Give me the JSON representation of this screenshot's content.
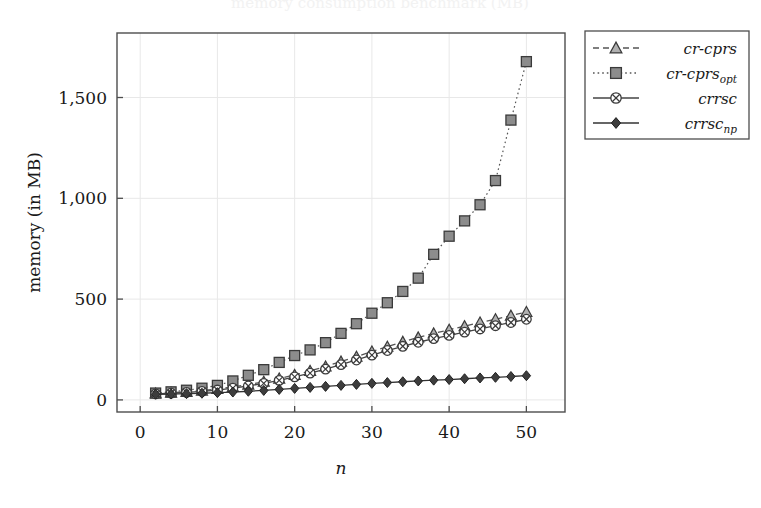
{
  "figure": {
    "faint_title": "memory consumption benchmark (MB)",
    "background_color": "#ffffff",
    "axis_color": "#4d4d4d",
    "grid_color": "#e8e8e8"
  },
  "axes": {
    "x": {
      "label": "n",
      "ticks": [
        0,
        10,
        20,
        30,
        40,
        50
      ],
      "tick_labels": [
        "0",
        "10",
        "20",
        "30",
        "40",
        "50"
      ],
      "range": [
        -3,
        55
      ]
    },
    "y": {
      "label": "memory (in MB)",
      "ticks": [
        0,
        500,
        1000,
        1500
      ],
      "tick_labels": [
        "0",
        "500",
        "1,000",
        "1,500"
      ],
      "range": [
        -60,
        1820
      ]
    }
  },
  "legend": {
    "position": "top-right-outside",
    "entries": [
      {
        "label": "cr-cprs",
        "sub": "",
        "marker": "triangle",
        "line": "dashed",
        "color": "#555555"
      },
      {
        "label": "cr-cprs",
        "sub": "opt",
        "marker": "square",
        "line": "dotted",
        "color": "#555555"
      },
      {
        "label": "crrsc",
        "sub": "",
        "marker": "circle-x",
        "line": "solid",
        "color": "#444444"
      },
      {
        "label": "crrsc",
        "sub": "np",
        "marker": "diamond",
        "line": "solid",
        "color": "#333333"
      }
    ]
  },
  "chart_data": {
    "type": "line",
    "title": "",
    "xlabel": "n",
    "ylabel": "memory (in MB)",
    "xlim": [
      -3,
      55
    ],
    "ylim": [
      -60,
      1820
    ],
    "grid": true,
    "legend_position": "top-right-outside",
    "x": [
      2,
      4,
      6,
      8,
      10,
      12,
      14,
      16,
      18,
      20,
      22,
      24,
      26,
      28,
      30,
      32,
      34,
      36,
      38,
      40,
      42,
      44,
      46,
      48,
      50
    ],
    "series": [
      {
        "name": "cr-cprs",
        "marker": "triangle",
        "line": "dashed",
        "color": "#555555",
        "values": [
          32,
          36,
          40,
          46,
          54,
          64,
          76,
          90,
          106,
          124,
          144,
          166,
          190,
          214,
          240,
          264,
          288,
          310,
          330,
          348,
          366,
          384,
          400,
          418,
          436
        ]
      },
      {
        "name": "cr-cprs_opt",
        "marker": "square",
        "line": "dotted",
        "color": "#555555",
        "values": [
          34,
          40,
          48,
          58,
          72,
          94,
          122,
          150,
          186,
          220,
          248,
          284,
          330,
          378,
          430,
          482,
          538,
          604,
          722,
          812,
          888,
          968,
          1088,
          1388,
          1678
        ]
      },
      {
        "name": "crrsc",
        "marker": "circle-x",
        "line": "solid",
        "color": "#444444",
        "values": [
          30,
          33,
          37,
          42,
          49,
          58,
          69,
          82,
          97,
          114,
          133,
          153,
          175,
          198,
          222,
          245,
          266,
          286,
          304,
          320,
          336,
          352,
          368,
          384,
          400
        ]
      },
      {
        "name": "crrsc_np",
        "marker": "diamond",
        "line": "solid",
        "color": "#333333",
        "values": [
          28,
          29,
          31,
          33,
          36,
          39,
          43,
          47,
          52,
          57,
          62,
          67,
          72,
          77,
          82,
          86,
          90,
          94,
          98,
          101,
          105,
          109,
          112,
          116,
          120
        ]
      }
    ]
  }
}
